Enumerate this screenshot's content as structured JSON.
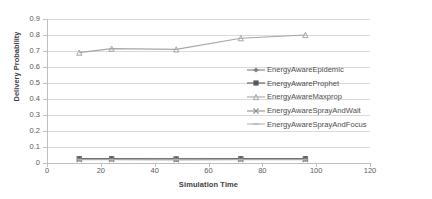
{
  "chart_data": {
    "type": "line",
    "title": "",
    "xlabel": "Simulation Time",
    "ylabel": "Delivery Probability",
    "xlim": [
      0,
      120
    ],
    "ylim": [
      0,
      0.9
    ],
    "grid": true,
    "legend_position": "right",
    "x": [
      12,
      24,
      48,
      72,
      96
    ],
    "xticks": [
      "0",
      "20",
      "40",
      "60",
      "80",
      "100",
      "120"
    ],
    "xtick_values": [
      0,
      20,
      40,
      60,
      80,
      100,
      120
    ],
    "yticks": [
      "0",
      "0.1",
      "0.2",
      "0.3",
      "0.4",
      "0.5",
      "0.6",
      "0.7",
      "0.8",
      "0.9"
    ],
    "ytick_values": [
      0,
      0.1,
      0.2,
      0.3,
      0.4,
      0.5,
      0.6,
      0.7,
      0.8,
      0.9
    ],
    "series": [
      {
        "name": "EnergyAwareEpidemic",
        "marker": "diamond",
        "color": "#7f7f7f",
        "values": [
          0.025,
          0.025,
          0.023,
          0.024,
          0.024
        ]
      },
      {
        "name": "EnergyAwareProphet",
        "marker": "square",
        "color": "#595959",
        "values": [
          0.027,
          0.027,
          0.026,
          0.027,
          0.027
        ]
      },
      {
        "name": "EnergyAwareMaxprop",
        "marker": "triangle",
        "color": "#a6a6a6",
        "values": [
          0.69,
          0.715,
          0.71,
          0.78,
          0.8
        ]
      },
      {
        "name": "EnergyAwareSprayAndWait",
        "marker": "cross",
        "color": "#8c8c8c",
        "values": [
          0.022,
          0.022,
          0.021,
          0.022,
          0.022
        ]
      },
      {
        "name": "EnergyAwareSprayAndFocus",
        "marker": "dash",
        "color": "#b3b3b3",
        "values": [
          0.02,
          0.02,
          0.02,
          0.02,
          0.02
        ]
      }
    ]
  },
  "legend": {
    "items": [
      {
        "label": "EnergyAwareEpidemic"
      },
      {
        "label": "EnergyAwareProphet"
      },
      {
        "label": "EnergyAwareMaxprop"
      },
      {
        "label": "EnergyAwareSprayAndWait"
      },
      {
        "label": "EnergyAwareSprayAndFocus"
      }
    ]
  }
}
